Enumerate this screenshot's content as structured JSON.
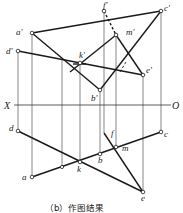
{
  "diagram": {
    "caption": "（b）作图结果",
    "axis": {
      "left_label": "X",
      "right_label": "O"
    },
    "labels": {
      "a_prime": "a'",
      "b_prime": "b'",
      "c_prime": "c'",
      "d_prime": "d'",
      "e_prime": "e'",
      "f_prime": "f'",
      "k_prime": "k'",
      "m_prime": "m'",
      "a": "a",
      "b": "b",
      "c": "c",
      "d": "d",
      "e": "e",
      "f": "f",
      "k": "k",
      "m": "m"
    },
    "colors": {
      "line": "#1a1a1a",
      "projector": "#555555",
      "background": "#ffffff"
    }
  }
}
